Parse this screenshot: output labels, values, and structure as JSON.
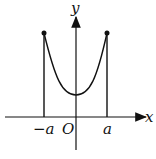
{
  "diagram": {
    "axes": {
      "x_label": "x",
      "y_label": "y",
      "origin_label": "O"
    },
    "ticks": {
      "left": "−a",
      "right": "a"
    },
    "curve": {
      "type": "catenary-like U curve",
      "endpoints": [
        "(-a, f(a))",
        "(a, f(a))"
      ]
    },
    "colors": {
      "stroke": "#111111",
      "background": "#ffffff"
    }
  }
}
